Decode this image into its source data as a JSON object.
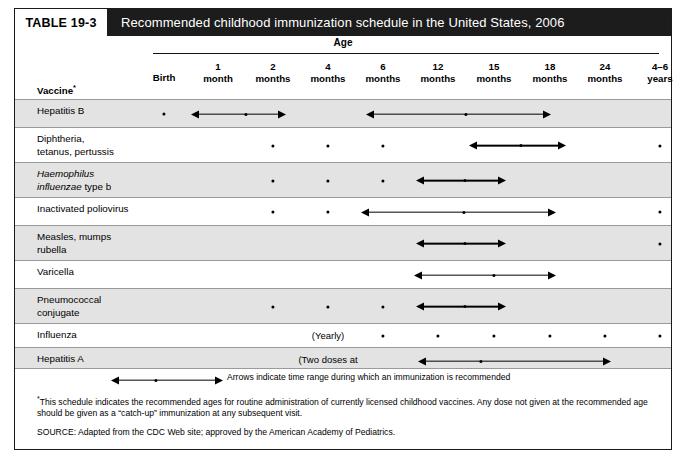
{
  "table": {
    "number_label": "TABLE 19-3",
    "title": "Recommended childhood immunization schedule in the United States, 2006",
    "age_header": "Age",
    "vaccine_header": "Vaccine",
    "vaccine_header_marker": "*",
    "colors": {
      "title_bar_bg": "#1c1c1c",
      "title_text": "#ffffff",
      "row_shaded_bg": "#e3e3e3",
      "row_plain_bg": "#ffffff",
      "border": "#1a1a1a",
      "rule": "#9a9a9a",
      "mark": "#000000"
    },
    "columns": [
      {
        "key": "birth",
        "label": "Birth",
        "center": 149
      },
      {
        "key": "1month",
        "label": "1\nmonth",
        "center": 203
      },
      {
        "key": "2months",
        "label": "2\nmonths",
        "center": 258
      },
      {
        "key": "4months",
        "label": "4\nmonths",
        "center": 313
      },
      {
        "key": "6months",
        "label": "6\nmonths",
        "center": 368
      },
      {
        "key": "12months",
        "label": "12\nmonths",
        "center": 423
      },
      {
        "key": "15months",
        "label": "15\nmonths",
        "center": 479
      },
      {
        "key": "18months",
        "label": "18\nmonths",
        "center": 535
      },
      {
        "key": "24months",
        "label": "24\nmonths",
        "center": 590
      },
      {
        "key": "4to6years",
        "label": "4–6\nyears",
        "center": 645
      }
    ],
    "rows": [
      {
        "label": "Hepatitis B",
        "label_italic_prefix": "",
        "shaded": true,
        "height": 28,
        "dots": [
          149
        ],
        "arrows": [
          {
            "x1": 176,
            "x2": 271,
            "mid": 231
          },
          {
            "x1": 351,
            "x2": 536,
            "mid": 451
          }
        ],
        "texts": []
      },
      {
        "label": "Diphtheria,\ntetanus, pertussis",
        "label_italic_prefix": "",
        "shaded": false,
        "height": 35,
        "dots": [
          258,
          313,
          368,
          645
        ],
        "arrows": [
          {
            "x1": 454,
            "x2": 551,
            "mid": 506
          }
        ],
        "texts": []
      },
      {
        "label_italic_prefix": "Haemophilus\ninfluenzae",
        "label": " type b",
        "shaded": true,
        "height": 35,
        "dots": [
          258,
          313,
          368
        ],
        "arrows": [
          {
            "x1": 401,
            "x2": 491,
            "mid": 450
          }
        ],
        "texts": []
      },
      {
        "label": "Inactivated poliovirus",
        "label_italic_prefix": "",
        "shaded": false,
        "height": 28,
        "dots": [
          258,
          313,
          645
        ],
        "arrows": [
          {
            "x1": 346,
            "x2": 541,
            "mid": 449
          }
        ],
        "texts": []
      },
      {
        "label": "Measles, mumps\nrubella",
        "label_italic_prefix": "",
        "shaded": true,
        "height": 35,
        "dots": [
          645
        ],
        "arrows": [
          {
            "x1": 401,
            "x2": 491,
            "mid": 450
          }
        ],
        "texts": []
      },
      {
        "label": "Varicella",
        "label_italic_prefix": "",
        "shaded": false,
        "height": 28,
        "dots": [],
        "arrows": [
          {
            "x1": 399,
            "x2": 541,
            "mid": 479
          }
        ],
        "texts": []
      },
      {
        "label": "Pneumococcal\nconjugate",
        "label_italic_prefix": "",
        "shaded": true,
        "height": 35,
        "dots": [
          258,
          313,
          368
        ],
        "arrows": [
          {
            "x1": 401,
            "x2": 491,
            "mid": 450
          }
        ],
        "texts": []
      },
      {
        "label": "Influenza",
        "label_italic_prefix": "",
        "shaded": false,
        "height": 24,
        "dots": [
          368,
          423,
          479,
          535,
          590,
          645
        ],
        "arrows": [],
        "texts": [
          {
            "value": "(Yearly)",
            "center": 313,
            "top": 6
          }
        ]
      },
      {
        "label": "Hepatitis A",
        "label_italic_prefix": "",
        "shaded": true,
        "height": 37,
        "dots": [],
        "arrows": [
          {
            "x1": 403,
            "x2": 596,
            "mid": 466,
            "top": 13
          },
          {
            "x1": 456,
            "x2": 651,
            "mid": 583,
            "top": 28
          }
        ],
        "texts": [
          {
            "value": "(Two doses at\nleast 6 months apart)",
            "center": 313,
            "top": 6
          }
        ]
      }
    ],
    "legend": {
      "text": "Arrows indicate time range during which an immunization is recommended",
      "arrow": {
        "x1": 96,
        "x2": 208,
        "mid": 141
      }
    },
    "footnotes": {
      "star_marker": "*",
      "star_note": "This schedule indicates the recommended ages for routine administration of currently licensed childhood vaccines. Any dose not given at the recommended age should be given as a “catch-up” immunization at any subsequent visit.",
      "source": "SOURCE: Adapted from the CDC Web site; approved by the American Academy of Pediatrics."
    }
  }
}
